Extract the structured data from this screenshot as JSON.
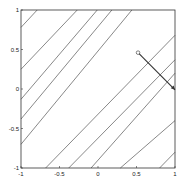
{
  "chart_data": {
    "type": "line",
    "title": "",
    "xlabel": "",
    "ylabel": "",
    "xlim": [
      -1,
      1
    ],
    "ylim": [
      -1,
      1
    ],
    "grid": false,
    "legend": null,
    "x_ticks": [
      -1,
      -0.5,
      0,
      0.5,
      1
    ],
    "y_ticks": [
      -1,
      -0.5,
      0,
      0.5,
      1
    ],
    "x_tick_labels": [
      "-1",
      "-0.5",
      "0",
      "0.5",
      "1"
    ],
    "y_tick_labels": [
      "-1",
      "-0.5",
      "0",
      "0.5",
      "1"
    ],
    "contour_lines": [
      {
        "x": [
          -1,
          -0.79
        ],
        "y": [
          0.78,
          1
        ]
      },
      {
        "x": [
          -1,
          -0.27
        ],
        "y": [
          0.25,
          1
        ]
      },
      {
        "x": [
          -1,
          -0.01
        ],
        "y": [
          -0.13,
          1
        ]
      },
      {
        "x": [
          -1,
          0.18
        ],
        "y": [
          -0.38,
          1
        ]
      },
      {
        "x": [
          -1,
          0.44
        ],
        "y": [
          -0.7,
          1
        ]
      },
      {
        "x": [
          -0.68,
          1
        ],
        "y": [
          -1,
          0.68
        ]
      },
      {
        "x": [
          -0.38,
          1
        ],
        "y": [
          -1,
          0.37
        ]
      },
      {
        "x": [
          -0.09,
          1
        ],
        "y": [
          -1,
          0.2
        ]
      },
      {
        "x": [
          0.29,
          1
        ],
        "y": [
          -1,
          -0.4
        ]
      },
      {
        "x": [
          0.8,
          1
        ],
        "y": [
          -1,
          -0.8
        ]
      }
    ],
    "annotation_path": {
      "start": {
        "x": 0.52,
        "y": 0.46,
        "marker": "circle"
      },
      "end": {
        "x": 1.0,
        "y": -0.01,
        "marker": "arrow"
      }
    },
    "colors": {
      "contour": "#555555",
      "path": "#333333",
      "axes": "#333333"
    }
  }
}
